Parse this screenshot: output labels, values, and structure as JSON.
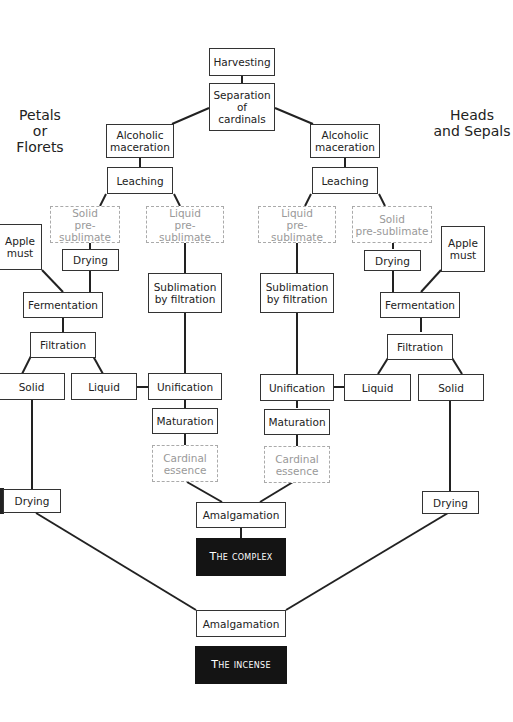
{
  "diagram": {
    "type": "flowchart",
    "side_labels": {
      "left": "Petals\nor Florets",
      "left_line1": "Petals",
      "left_line2": "or Florets",
      "right_line1": "Heads",
      "right_line2": "and Sepals"
    },
    "nodes": {
      "harvesting": "Harvesting",
      "separation": "Separation\nof\ncardinals",
      "separation_l1": "Separation",
      "separation_l2": "of",
      "separation_l3": "cardinals",
      "left_maceration_l1": "Alcoholic",
      "left_maceration_l2": "maceration",
      "right_maceration_l1": "Alcoholic",
      "right_maceration_l2": "maceration",
      "left_leaching": "Leaching",
      "right_leaching": "Leaching",
      "left_solid_presub_l1": "Solid",
      "left_solid_presub_l2": "pre-sublimate",
      "left_liquid_presub_l1": "Liquid",
      "left_liquid_presub_l2": "pre-sublimate",
      "right_liquid_presub_l1": "Liquid",
      "right_liquid_presub_l2": "pre-sublimate",
      "right_solid_presub_l1": "Solid",
      "right_solid_presub_l2": "pre-sublimate",
      "left_apple_l1": "Apple",
      "left_apple_l2": "must",
      "right_apple_l1": "Apple",
      "right_apple_l2": "must",
      "left_drying_small": "Drying",
      "right_drying_small": "Drying",
      "left_fermentation": "Fermentation",
      "right_fermentation": "Fermentation",
      "left_sublimation_l1": "Sublimation",
      "left_sublimation_l2": "by filtration",
      "right_sublimation_l1": "Sublimation",
      "right_sublimation_l2": "by filtration",
      "left_filtration": "Filtration",
      "right_filtration": "Filtration",
      "left_solid": "Solid",
      "left_liquid": "Liquid",
      "right_liquid": "Liquid",
      "right_solid": "Solid",
      "left_unification": "Unification",
      "right_unification": "Unification",
      "left_maturation": "Maturation",
      "right_maturation": "Maturation",
      "left_essence_l1": "Cardinal",
      "left_essence_l2": "essence",
      "right_essence_l1": "Cardinal",
      "right_essence_l2": "essence",
      "left_drying_bottom": "Drying",
      "right_drying_bottom": "Drying",
      "amalgamation_1": "Amalgamation",
      "the_complex": "The complex",
      "amalgamation_2": "Amalgamation",
      "the_incense": "The incense"
    },
    "colors": {
      "line": "#222222",
      "dashed_border": "#aaaaaa",
      "dashed_text": "#999999",
      "dark_fill": "#141414"
    }
  }
}
